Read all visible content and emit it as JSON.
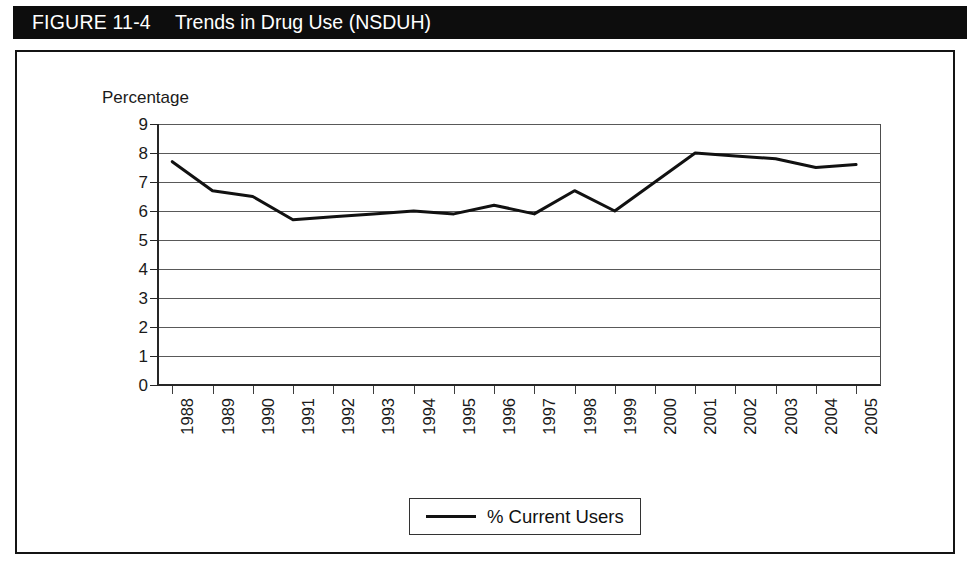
{
  "figure": {
    "number_label": "FIGURE 11-4",
    "title": "Trends in Drug Use (NSDUH)"
  },
  "legend": {
    "entries": [
      {
        "label": "% Current Users",
        "color": "#111111"
      }
    ]
  },
  "colors": {
    "title_bar_background": "#0d0d0d",
    "title_text": "#ffffff",
    "frame_border": "#141414",
    "gridline": "#595959",
    "axis": "#262626",
    "series_line": "#111111",
    "page_background": "#ffffff"
  },
  "chart_data": {
    "type": "line",
    "title": "Trends in Drug Use (NSDUH)",
    "xlabel": "",
    "ylabel": "Percentage",
    "ylim": [
      0,
      9
    ],
    "ytick_labels": [
      "0",
      "1",
      "2",
      "3",
      "4",
      "5",
      "6",
      "7",
      "8",
      "9"
    ],
    "yticks": [
      0,
      1,
      2,
      3,
      4,
      5,
      6,
      7,
      8,
      9
    ],
    "grid": true,
    "legend_position": "bottom-center",
    "categories": [
      "1988",
      "1989",
      "1990",
      "1991",
      "1992",
      "1993",
      "1994",
      "1995",
      "1996",
      "1997",
      "1998",
      "1999",
      "2000",
      "2001",
      "2002",
      "2003",
      "2004",
      "2005"
    ],
    "series": [
      {
        "name": "% Current Users",
        "color": "#111111",
        "values": [
          7.7,
          6.7,
          6.5,
          5.7,
          5.8,
          5.9,
          6.0,
          5.9,
          6.2,
          5.9,
          6.7,
          6.0,
          7.0,
          8.0,
          7.9,
          7.8,
          7.5,
          7.6
        ]
      }
    ]
  }
}
